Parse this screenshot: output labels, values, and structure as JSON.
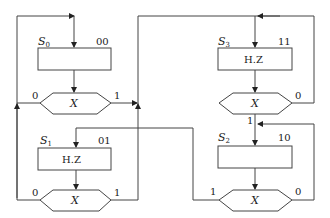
{
  "diagram": {
    "type": "ASM chart",
    "states": [
      {
        "id": "S0",
        "name": "S",
        "sub": "0",
        "code": "00",
        "output": "",
        "decision": "X",
        "branch_left": "0",
        "branch_right": "1"
      },
      {
        "id": "S1",
        "name": "S",
        "sub": "1",
        "code": "01",
        "output": "H.Z",
        "decision": "X",
        "branch_left": "0",
        "branch_right": "1"
      },
      {
        "id": "S3",
        "name": "S",
        "sub": "3",
        "code": "11",
        "output": "H.Z",
        "decision": "X",
        "branch_bottom": "1",
        "branch_right": "0"
      },
      {
        "id": "S2",
        "name": "S",
        "sub": "2",
        "code": "10",
        "output": "",
        "decision": "X",
        "branch_left": "1",
        "branch_right": "0"
      }
    ],
    "transitions": [
      {
        "from": "S0",
        "cond": "X=0",
        "to": "S0"
      },
      {
        "from": "S0",
        "cond": "X=1",
        "to": "S3"
      },
      {
        "from": "S1",
        "cond": "X=0",
        "to": "S0"
      },
      {
        "from": "S1",
        "cond": "X=1",
        "to": "S3"
      },
      {
        "from": "S3",
        "cond": "X=0",
        "to": "S3"
      },
      {
        "from": "S3",
        "cond": "X=1",
        "to": "S2"
      },
      {
        "from": "S2",
        "cond": "X=0",
        "to": "S2"
      },
      {
        "from": "S2",
        "cond": "X=1",
        "to": "S1"
      }
    ]
  }
}
